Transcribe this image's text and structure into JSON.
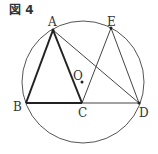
{
  "figure": {
    "title": "図 4",
    "circle": {
      "cx": 83,
      "cy": 82,
      "r": 61,
      "stroke": "#555555",
      "label": "O"
    },
    "points": {
      "A": {
        "x": 53,
        "y": 30
      },
      "B": {
        "x": 26,
        "y": 103
      },
      "C": {
        "x": 82,
        "y": 103
      },
      "D": {
        "x": 139,
        "y": 103
      },
      "E": {
        "x": 111,
        "y": 28
      },
      "O": {
        "x": 82,
        "y": 82
      }
    },
    "labels": {
      "A": "A",
      "B": "B",
      "C": "C",
      "D": "D",
      "E": "E",
      "O": "O"
    },
    "thick_segments": [
      "AB",
      "AC",
      "BC"
    ],
    "thin_segments": [
      "CD",
      "AD",
      "CE",
      "ED"
    ]
  }
}
